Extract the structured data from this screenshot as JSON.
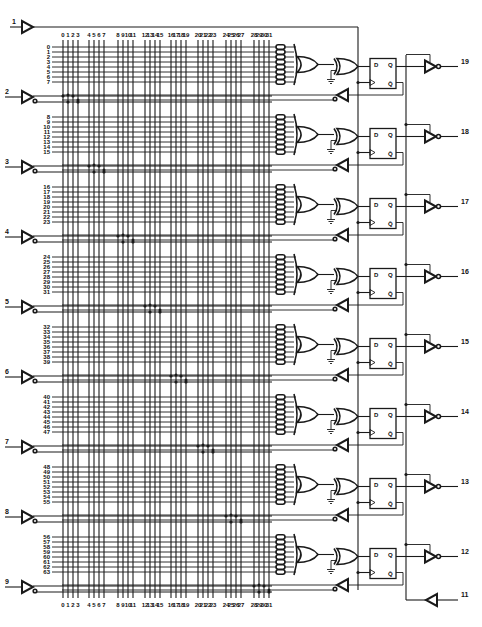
{
  "diagram": {
    "title": "",
    "type": "PAL registered logic diagram",
    "columns": {
      "labels": [
        "0",
        "1",
        "2",
        "3",
        "4",
        "5",
        "6",
        "7",
        "8",
        "9",
        "10",
        "11",
        "12",
        "13",
        "14",
        "15",
        "16",
        "17",
        "18",
        "19",
        "20",
        "21",
        "22",
        "23",
        "24",
        "25",
        "26",
        "27",
        "28",
        "29",
        "30",
        "31"
      ],
      "group_x": [
        63,
        89,
        118,
        145,
        171,
        198,
        226,
        254
      ],
      "spacing": 5
    },
    "input_pins": [
      {
        "pin": "1",
        "role": "clock",
        "y": 27
      },
      {
        "pin": "2",
        "y": 97
      },
      {
        "pin": "3",
        "y": 167
      },
      {
        "pin": "4",
        "y": 237
      },
      {
        "pin": "5",
        "y": 307
      },
      {
        "pin": "6",
        "y": 377
      },
      {
        "pin": "7",
        "y": 447
      },
      {
        "pin": "8",
        "y": 517
      },
      {
        "pin": "9",
        "y": 587
      }
    ],
    "macrocells": [
      {
        "output_pin": "19",
        "product_terms": [
          "0",
          "1",
          "2",
          "3",
          "4",
          "5",
          "6",
          "7"
        ],
        "top_y": 47
      },
      {
        "output_pin": "18",
        "product_terms": [
          "8",
          "9",
          "10",
          "11",
          "12",
          "13",
          "14",
          "15"
        ],
        "top_y": 117
      },
      {
        "output_pin": "17",
        "product_terms": [
          "16",
          "17",
          "18",
          "19",
          "20",
          "21",
          "22",
          "23"
        ],
        "top_y": 187
      },
      {
        "output_pin": "16",
        "product_terms": [
          "24",
          "25",
          "26",
          "27",
          "28",
          "29",
          "30",
          "31"
        ],
        "top_y": 257
      },
      {
        "output_pin": "15",
        "product_terms": [
          "32",
          "33",
          "34",
          "35",
          "36",
          "37",
          "38",
          "39"
        ],
        "top_y": 327
      },
      {
        "output_pin": "14",
        "product_terms": [
          "40",
          "41",
          "42",
          "43",
          "44",
          "45",
          "46",
          "47"
        ],
        "top_y": 397
      },
      {
        "output_pin": "13",
        "product_terms": [
          "48",
          "49",
          "50",
          "51",
          "52",
          "53",
          "54",
          "55"
        ],
        "top_y": 467
      },
      {
        "output_pin": "12",
        "product_terms": [
          "56",
          "57",
          "58",
          "59",
          "60",
          "61",
          "62",
          "63"
        ],
        "top_y": 537
      }
    ],
    "oe_pin": {
      "pin": "11",
      "role": "output enable"
    },
    "flipflop_labels": {
      "d": "D",
      "q": "Q",
      "qbar": "Q̄"
    }
  }
}
